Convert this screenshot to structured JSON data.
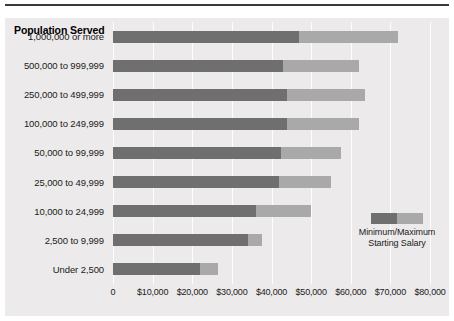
{
  "chart_data": {
    "type": "bar",
    "orientation": "horizontal",
    "title": "",
    "axis_group_title": "Population Served",
    "xlabel": "",
    "ylabel": "Population Served",
    "xlim": [
      0,
      80000
    ],
    "xticks": [
      0,
      10000,
      20000,
      30000,
      40000,
      50000,
      60000,
      70000,
      80000
    ],
    "xtick_labels": [
      "0",
      "$10,000",
      "$20,000",
      "$30,000",
      "$40,000",
      "$50,000",
      "$60,000",
      "$70,000",
      "$80,000"
    ],
    "grid": true,
    "legend_position": "inside-right",
    "legend_entries": [
      "Minimum/Maximum Starting Salary"
    ],
    "legend_text_line1": "Minimum/Maximum",
    "legend_text_line2": "Starting Salary",
    "categories": [
      "1,000,000 or more",
      "500,000 to 999,999",
      "250,000 to 499,999",
      "100,000 to 249,999",
      "50,000 to 99,999",
      "25,000 to 49,999",
      "10,000 to 24,999",
      "2,500 to 9,999",
      "Under 2,500"
    ],
    "series": [
      {
        "name": "Minimum Starting Salary",
        "color": "#6f6f6f",
        "values": [
          47000,
          43000,
          44000,
          44000,
          42500,
          42000,
          36000,
          34000,
          22000
        ]
      },
      {
        "name": "Maximum Starting Salary",
        "color": "#a9a9a9",
        "values": [
          72000,
          62000,
          63500,
          62000,
          57500,
          55000,
          50000,
          37500,
          26500
        ]
      }
    ]
  }
}
